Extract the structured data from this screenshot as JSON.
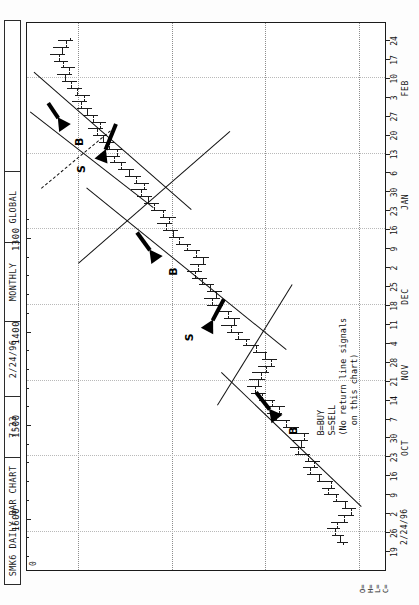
{
  "header": {
    "cells": [
      {
        "name": "chart-title",
        "text": "SMK6 DAILY BAR CHART"
      },
      {
        "name": "time",
        "text": "7:33"
      },
      {
        "name": "date",
        "text": "2/24/96"
      },
      {
        "name": "period",
        "text": "MONTHLY"
      },
      {
        "name": "source",
        "text": "GLOBAL"
      },
      {
        "name": "spare",
        "text": ""
      }
    ]
  },
  "corner": {
    "zero_marker": "0",
    "ohlc_labels": "O=\nH=\nL=\nC=",
    "date_stamp": "2/24/96"
  },
  "legend": {
    "line1": "B=BUY",
    "line2": "S=SELL",
    "line3": "(No return line signals",
    "line4": "  on this chart)"
  },
  "signals": [
    {
      "name": "signal-buy-1",
      "label": "B"
    },
    {
      "name": "signal-sell-1",
      "label": "S"
    },
    {
      "name": "signal-buy-2",
      "label": "B"
    },
    {
      "name": "signal-sell-2",
      "label": "S"
    },
    {
      "name": "signal-buy-3",
      "label": "B"
    }
  ],
  "chart_data": {
    "type": "bar",
    "subtype": "ohlc-bar-chart",
    "title": "SMK6 DAILY BAR CHART",
    "xlabel": "",
    "ylabel": "",
    "grid": true,
    "legend_position": "inside-lower-left",
    "orientation": "portrait-page-rotated-90",
    "ylim": [
      1270,
      1655
    ],
    "price_ticks": [
      1600,
      1500,
      1400,
      1300
    ],
    "price_tick_minor_step": 20,
    "xlim_labels": [
      "19",
      "26",
      "2",
      "9",
      "16",
      "23",
      "30",
      "7",
      "14",
      "21",
      "28",
      "4",
      "11",
      "18",
      "25",
      "2",
      "9",
      "16",
      "23",
      "30",
      "6",
      "13",
      "20",
      "27",
      "3",
      "10",
      "17",
      "24"
    ],
    "month_labels": [
      {
        "label": "OCT",
        "at_index": 5
      },
      {
        "label": "NOV",
        "at_index": 9
      },
      {
        "label": "DEC",
        "at_index": 13
      },
      {
        "label": "JAN",
        "at_index": 18
      },
      {
        "label": "FEB",
        "at_index": 24
      }
    ],
    "bars": [
      {
        "i": 0,
        "o": 1317,
        "h": 1324,
        "l": 1312,
        "c": 1320
      },
      {
        "i": 1,
        "o": 1320,
        "h": 1329,
        "l": 1316,
        "c": 1326
      },
      {
        "i": 2,
        "o": 1326,
        "h": 1334,
        "l": 1320,
        "c": 1323
      },
      {
        "i": 3,
        "o": 1323,
        "h": 1330,
        "l": 1312,
        "c": 1316
      },
      {
        "i": 4,
        "o": 1316,
        "h": 1322,
        "l": 1305,
        "c": 1309
      },
      {
        "i": 5,
        "o": 1309,
        "h": 1318,
        "l": 1303,
        "c": 1315
      },
      {
        "i": 6,
        "o": 1315,
        "h": 1328,
        "l": 1312,
        "c": 1325
      },
      {
        "i": 7,
        "o": 1325,
        "h": 1337,
        "l": 1321,
        "c": 1333
      },
      {
        "i": 8,
        "o": 1333,
        "h": 1340,
        "l": 1326,
        "c": 1330
      },
      {
        "i": 9,
        "o": 1330,
        "h": 1345,
        "l": 1328,
        "c": 1343
      },
      {
        "i": 10,
        "o": 1343,
        "h": 1356,
        "l": 1340,
        "c": 1352
      },
      {
        "i": 11,
        "o": 1352,
        "h": 1360,
        "l": 1344,
        "c": 1348
      },
      {
        "i": 12,
        "o": 1348,
        "h": 1358,
        "l": 1342,
        "c": 1355
      },
      {
        "i": 13,
        "o": 1355,
        "h": 1368,
        "l": 1352,
        "c": 1365
      },
      {
        "i": 14,
        "o": 1365,
        "h": 1374,
        "l": 1358,
        "c": 1362
      },
      {
        "i": 15,
        "o": 1362,
        "h": 1372,
        "l": 1355,
        "c": 1359
      },
      {
        "i": 16,
        "o": 1359,
        "h": 1370,
        "l": 1353,
        "c": 1367
      },
      {
        "i": 17,
        "o": 1367,
        "h": 1381,
        "l": 1364,
        "c": 1378
      },
      {
        "i": 18,
        "o": 1378,
        "h": 1392,
        "l": 1374,
        "c": 1389
      },
      {
        "i": 19,
        "o": 1389,
        "h": 1398,
        "l": 1382,
        "c": 1386
      },
      {
        "i": 20,
        "o": 1386,
        "h": 1396,
        "l": 1379,
        "c": 1393
      },
      {
        "i": 21,
        "o": 1393,
        "h": 1407,
        "l": 1390,
        "c": 1404
      },
      {
        "i": 22,
        "o": 1404,
        "h": 1415,
        "l": 1399,
        "c": 1411
      },
      {
        "i": 23,
        "o": 1411,
        "h": 1420,
        "l": 1404,
        "c": 1408
      },
      {
        "i": 24,
        "o": 1408,
        "h": 1418,
        "l": 1400,
        "c": 1405
      },
      {
        "i": 25,
        "o": 1405,
        "h": 1414,
        "l": 1396,
        "c": 1399
      },
      {
        "i": 26,
        "o": 1399,
        "h": 1408,
        "l": 1390,
        "c": 1394
      },
      {
        "i": 27,
        "o": 1394,
        "h": 1404,
        "l": 1388,
        "c": 1401
      },
      {
        "i": 28,
        "o": 1401,
        "h": 1413,
        "l": 1398,
        "c": 1410
      },
      {
        "i": 29,
        "o": 1410,
        "h": 1424,
        "l": 1407,
        "c": 1421
      },
      {
        "i": 30,
        "o": 1421,
        "h": 1433,
        "l": 1417,
        "c": 1429
      },
      {
        "i": 31,
        "o": 1429,
        "h": 1441,
        "l": 1424,
        "c": 1437
      },
      {
        "i": 32,
        "o": 1437,
        "h": 1448,
        "l": 1430,
        "c": 1434
      },
      {
        "i": 33,
        "o": 1434,
        "h": 1444,
        "l": 1427,
        "c": 1440
      },
      {
        "i": 34,
        "o": 1440,
        "h": 1453,
        "l": 1436,
        "c": 1450
      },
      {
        "i": 35,
        "o": 1450,
        "h": 1462,
        "l": 1445,
        "c": 1457
      },
      {
        "i": 36,
        "o": 1457,
        "h": 1466,
        "l": 1449,
        "c": 1453
      },
      {
        "i": 37,
        "o": 1453,
        "h": 1463,
        "l": 1446,
        "c": 1459
      },
      {
        "i": 38,
        "o": 1459,
        "h": 1471,
        "l": 1455,
        "c": 1468
      },
      {
        "i": 39,
        "o": 1468,
        "h": 1479,
        "l": 1463,
        "c": 1475
      },
      {
        "i": 40,
        "o": 1475,
        "h": 1484,
        "l": 1468,
        "c": 1472
      },
      {
        "i": 41,
        "o": 1472,
        "h": 1481,
        "l": 1464,
        "c": 1467
      },
      {
        "i": 42,
        "o": 1467,
        "h": 1477,
        "l": 1460,
        "c": 1474
      },
      {
        "i": 43,
        "o": 1474,
        "h": 1487,
        "l": 1470,
        "c": 1484
      },
      {
        "i": 44,
        "o": 1484,
        "h": 1496,
        "l": 1480,
        "c": 1492
      },
      {
        "i": 45,
        "o": 1492,
        "h": 1503,
        "l": 1487,
        "c": 1499
      },
      {
        "i": 46,
        "o": 1499,
        "h": 1510,
        "l": 1494,
        "c": 1506
      },
      {
        "i": 47,
        "o": 1506,
        "h": 1516,
        "l": 1500,
        "c": 1503
      },
      {
        "i": 48,
        "o": 1503,
        "h": 1513,
        "l": 1496,
        "c": 1510
      },
      {
        "i": 49,
        "o": 1510,
        "h": 1522,
        "l": 1506,
        "c": 1519
      },
      {
        "i": 50,
        "o": 1519,
        "h": 1530,
        "l": 1514,
        "c": 1526
      },
      {
        "i": 51,
        "o": 1526,
        "h": 1537,
        "l": 1521,
        "c": 1533
      },
      {
        "i": 52,
        "o": 1533,
        "h": 1544,
        "l": 1527,
        "c": 1530
      },
      {
        "i": 53,
        "o": 1530,
        "h": 1541,
        "l": 1524,
        "c": 1538
      },
      {
        "i": 54,
        "o": 1538,
        "h": 1550,
        "l": 1533,
        "c": 1546
      },
      {
        "i": 55,
        "o": 1546,
        "h": 1558,
        "l": 1541,
        "c": 1554
      },
      {
        "i": 56,
        "o": 1554,
        "h": 1566,
        "l": 1549,
        "c": 1562
      },
      {
        "i": 57,
        "o": 1562,
        "h": 1573,
        "l": 1556,
        "c": 1559
      },
      {
        "i": 58,
        "o": 1559,
        "h": 1570,
        "l": 1553,
        "c": 1567
      },
      {
        "i": 59,
        "o": 1567,
        "h": 1578,
        "l": 1562,
        "c": 1574
      },
      {
        "i": 60,
        "o": 1574,
        "h": 1584,
        "l": 1569,
        "c": 1580
      },
      {
        "i": 61,
        "o": 1580,
        "h": 1590,
        "l": 1574,
        "c": 1577
      },
      {
        "i": 62,
        "o": 1577,
        "h": 1587,
        "l": 1570,
        "c": 1584
      },
      {
        "i": 63,
        "o": 1584,
        "h": 1595,
        "l": 1579,
        "c": 1591
      },
      {
        "i": 64,
        "o": 1591,
        "h": 1601,
        "l": 1585,
        "c": 1597
      },
      {
        "i": 65,
        "o": 1597,
        "h": 1607,
        "l": 1591,
        "c": 1594
      },
      {
        "i": 66,
        "o": 1594,
        "h": 1604,
        "l": 1588,
        "c": 1601
      },
      {
        "i": 67,
        "o": 1601,
        "h": 1612,
        "l": 1596,
        "c": 1608
      },
      {
        "i": 68,
        "o": 1608,
        "h": 1618,
        "l": 1602,
        "c": 1614
      },
      {
        "i": 69,
        "o": 1614,
        "h": 1623,
        "l": 1607,
        "c": 1610
      },
      {
        "i": 70,
        "o": 1610,
        "h": 1619,
        "l": 1604,
        "c": 1616
      },
      {
        "i": 71,
        "o": 1616,
        "h": 1626,
        "l": 1611,
        "c": 1621
      },
      {
        "i": 72,
        "o": 1621,
        "h": 1630,
        "l": 1614,
        "c": 1618
      },
      {
        "i": 73,
        "o": 1618,
        "h": 1627,
        "l": 1610,
        "c": 1613
      },
      {
        "i": 74,
        "o": 1613,
        "h": 1622,
        "l": 1606,
        "c": 1609
      }
    ],
    "trendlines": [
      {
        "name": "up-channel-1",
        "x1": 0.115,
        "y1": 1298,
        "x2": 0.36,
        "y2": 1448,
        "style": "solid"
      },
      {
        "name": "down-reaction-1",
        "x1": 0.3,
        "y1": 1452,
        "x2": 0.52,
        "y2": 1372,
        "style": "solid"
      },
      {
        "name": "up-channel-2",
        "x1": 0.4,
        "y1": 1378,
        "x2": 0.695,
        "y2": 1592,
        "style": "solid"
      },
      {
        "name": "down-reaction-2",
        "x1": 0.56,
        "y1": 1600,
        "x2": 0.8,
        "y2": 1438,
        "style": "solid"
      },
      {
        "name": "up-channel-3",
        "x1": 0.655,
        "y1": 1480,
        "x2": 0.905,
        "y2": 1648,
        "style": "solid"
      },
      {
        "name": "steep-up-line",
        "x1": 0.66,
        "y1": 1520,
        "x2": 0.835,
        "y2": 1652,
        "style": "solid"
      },
      {
        "name": "return-line-dashed",
        "x1": 0.695,
        "y1": 1640,
        "x2": 0.8,
        "y2": 1566,
        "style": "dashed"
      }
    ]
  }
}
